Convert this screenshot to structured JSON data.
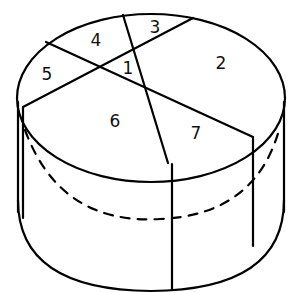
{
  "diagram": {
    "stroke_color": "#000000",
    "background": "#ffffff",
    "regions": [
      {
        "id": "region-1",
        "label": "1",
        "x": 128,
        "y": 68
      },
      {
        "id": "region-2",
        "label": "2",
        "x": 221,
        "y": 63
      },
      {
        "id": "region-3",
        "label": "3",
        "x": 155,
        "y": 27
      },
      {
        "id": "region-4",
        "label": "4",
        "x": 96,
        "y": 40
      },
      {
        "id": "region-5",
        "label": "5",
        "x": 47,
        "y": 74
      },
      {
        "id": "region-6",
        "label": "6",
        "x": 115,
        "y": 121
      },
      {
        "id": "region-7",
        "label": "7",
        "x": 196,
        "y": 133
      }
    ]
  }
}
